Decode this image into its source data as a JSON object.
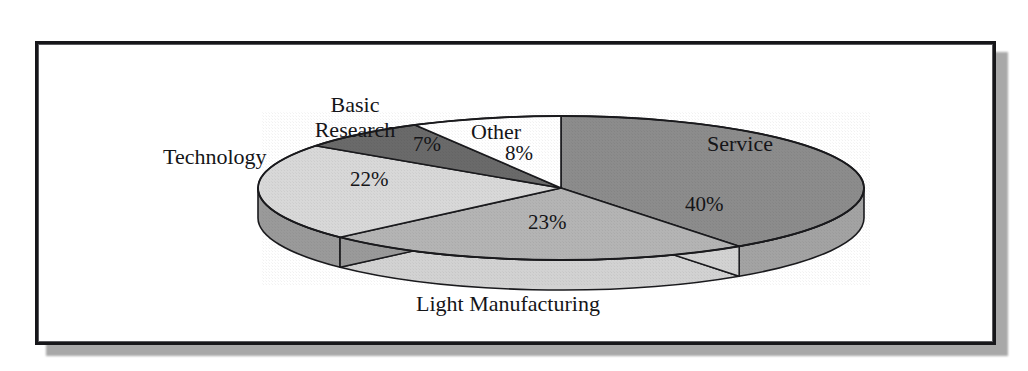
{
  "figure": {
    "kind": "pie-chart-figure",
    "frame_border_color": "#17171a",
    "frame_background": "#ffffff",
    "page_background": "#ffffff",
    "shadow_color": "#a8a8a8"
  },
  "chart_data": {
    "type": "pie",
    "title": "",
    "subtitle": "",
    "xlabel": "",
    "ylabel": "",
    "legend_position": "none",
    "grid": false,
    "three_d": true,
    "start_angle_clock": "12 o'clock",
    "direction": "clockwise",
    "categories": [
      "Service",
      "Light Manufacturing",
      "Technology",
      "Basic Research",
      "Other"
    ],
    "values": [
      40,
      23,
      22,
      7,
      8
    ],
    "value_unit": "%",
    "slices": [
      {
        "label": "Service",
        "value": 40,
        "value_label": "40%",
        "top_color": "#8c8c8c",
        "side_color": "#a3a3a3",
        "edge_color": "#1a1a1d"
      },
      {
        "label": "Light Manufacturing",
        "value": 23,
        "value_label": "23%",
        "top_color": "#b4b4b4",
        "side_color": "#d2d2d2",
        "edge_color": "#1a1a1d"
      },
      {
        "label": "Technology",
        "value": 22,
        "value_label": "22%",
        "top_color": "#d8d8d8",
        "side_color": "#9a9a9a",
        "edge_color": "#1a1a1d"
      },
      {
        "label": "Basic Research",
        "value": 7,
        "value_label": "7%",
        "top_color": "#6a6a6a",
        "side_color": "#6a6a6a",
        "edge_color": "#1a1a1d"
      },
      {
        "label": "Other",
        "value": 8,
        "value_label": "8%",
        "top_color": "#ffffff",
        "side_color": "#ffffff",
        "edge_color": "#1a1a1d"
      }
    ],
    "labels": {
      "service": "Service",
      "light_manufacturing": "Light Manufacturing",
      "technology": "Technology",
      "basic_research": "Basic\nResearch",
      "basic_research_line1": "Basic",
      "basic_research_line2": "Research",
      "other": "Other"
    },
    "value_labels": {
      "service": "40%",
      "light_manufacturing": "23%",
      "technology": "22%",
      "basic_research": "7%",
      "other": "8%"
    }
  }
}
